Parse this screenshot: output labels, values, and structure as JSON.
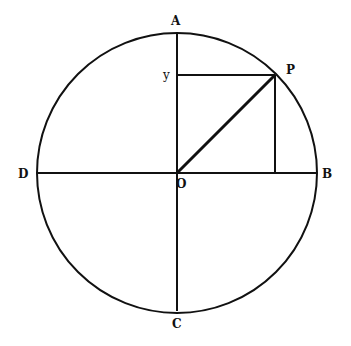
{
  "diagram": {
    "type": "unit-circle",
    "labels": {
      "A": "A",
      "B": "B",
      "C": "C",
      "D": "D",
      "O": "O",
      "P": "P",
      "y": "y"
    },
    "geometry": {
      "center": [
        177,
        173
      ],
      "radius": 140,
      "P": [
        275,
        75
      ]
    },
    "stroke_color": "#111111"
  }
}
